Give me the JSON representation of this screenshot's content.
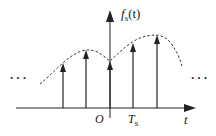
{
  "diagram": {
    "y_axis": {
      "label_main": "f",
      "label_sub": "s",
      "label_arg": "(t)"
    },
    "x_axis": {
      "label": "t"
    },
    "origin_label": "O",
    "period_label_main": "T",
    "period_label_sub": "s",
    "ellipsis_left": "···",
    "ellipsis_right": "···",
    "samples": [
      {
        "x": 63,
        "top": 64
      },
      {
        "x": 86,
        "top": 50
      },
      {
        "x": 110,
        "top": 62
      },
      {
        "x": 133,
        "top": 43
      },
      {
        "x": 157,
        "top": 35
      }
    ],
    "colors": {
      "stroke": "#222222",
      "background": "#ffffff"
    }
  }
}
